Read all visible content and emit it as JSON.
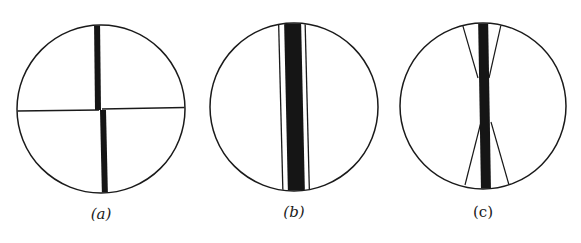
{
  "figure": {
    "panels": [
      {
        "id": "a",
        "label": "(a)",
        "description": "Circular field with thick vertical bar offset at a thin horizontal line",
        "circle": {
          "cx": 101,
          "cy": 109,
          "r": 84
        },
        "label_pos": {
          "x": 101,
          "y": 219
        }
      },
      {
        "id": "b",
        "label": "(b)",
        "description": "Circular field with thick vertical band flanked by thin parallel lines",
        "circle": {
          "cx": 294,
          "cy": 107,
          "r": 84
        },
        "label_pos": {
          "x": 294,
          "y": 217
        }
      },
      {
        "id": "c",
        "label": "(c)",
        "description": "Circular field with thick vertical bar and thin lines converging in hourglass shape",
        "circle": {
          "cx": 483,
          "cy": 106,
          "r": 83
        },
        "label_pos": {
          "x": 483,
          "y": 217
        }
      }
    ],
    "colors": {
      "background": "#ffffff",
      "stroke": "#1a1a1a",
      "fill_dark": "#151515"
    }
  }
}
